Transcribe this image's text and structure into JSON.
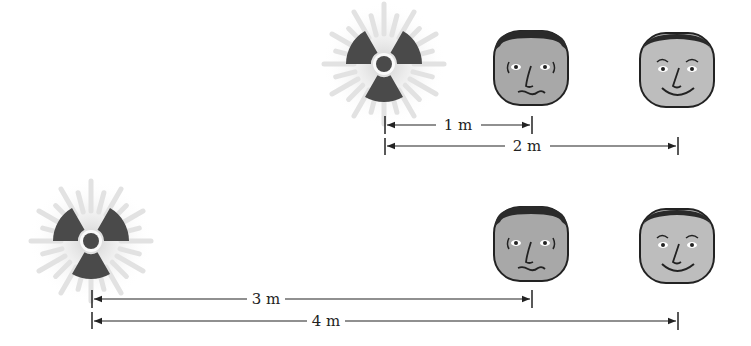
{
  "rows": [
    {
      "source": {
        "icon": "radiation-trefoil-icon"
      },
      "faces": [
        {
          "icon": "worried-face-icon",
          "expression": "worried"
        },
        {
          "icon": "smiling-face-icon",
          "expression": "smiling"
        }
      ],
      "distances": [
        {
          "label": "1 m",
          "to": "worried-face"
        },
        {
          "label": "2 m",
          "to": "smiling-face"
        }
      ]
    },
    {
      "source": {
        "icon": "radiation-trefoil-icon"
      },
      "faces": [
        {
          "icon": "worried-face-icon",
          "expression": "worried"
        },
        {
          "icon": "smiling-face-icon",
          "expression": "smiling"
        }
      ],
      "distances": [
        {
          "label": "3 m",
          "to": "worried-face"
        },
        {
          "label": "4 m",
          "to": "smiling-face"
        }
      ]
    }
  ],
  "colors": {
    "trefoil": "#4a4a4a",
    "glow": "#d9d9d9",
    "face": "#a8a8a8",
    "face_light": "#bdbdbd",
    "hair": "#2a2a2a",
    "line": "#222222"
  }
}
